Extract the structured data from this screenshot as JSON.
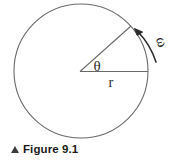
{
  "figure": {
    "caption_marker": "triangle-up-marker",
    "caption_text": "Figure 9.1",
    "background_color": "#ffffff",
    "stroke_color": "#6b6b6b",
    "label_color": "#2b2b2b",
    "caption_color": "#1a1a1a"
  },
  "diagram": {
    "type": "circular-motion-diagram",
    "circle": {
      "name": "circle-outline",
      "center_x": 81,
      "center_y": 71,
      "radius": 67
    },
    "radius_horizontal": {
      "name": "radius-horizontal-line",
      "from_x": 81,
      "from_y": 71,
      "to_x": 148,
      "to_y": 71
    },
    "radius_angled": {
      "name": "radius-angled-line",
      "from_x": 81,
      "from_y": 71,
      "to_x": 131,
      "to_y": 26
    },
    "labels": {
      "theta": "θ",
      "radius": "r",
      "omega": "ω"
    },
    "arrow": {
      "name": "angular-velocity-arrow",
      "direction": "counter-clockwise"
    }
  }
}
